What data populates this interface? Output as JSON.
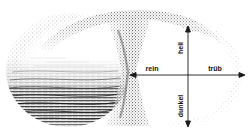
{
  "figure": {
    "title": "",
    "background_color": "#ffffff",
    "ink_color": "#111111"
  },
  "axes": {
    "center": {
      "x": 188,
      "y": 75
    },
    "horizontal": {
      "x1": 132,
      "x2": 245,
      "y": 75
    },
    "vertical": {
      "y1": 26,
      "y2": 127,
      "x": 188
    },
    "labels": {
      "top": "hell",
      "bottom": "dunkel",
      "left": "rein",
      "right": "trüb"
    }
  },
  "lobes": [
    {
      "name": "left-lobe",
      "cx": 68,
      "cy": 70,
      "rx": 62,
      "ry": 58,
      "fill": "hatched",
      "hatch_note": "dense horizontal scribble in lower half, white upper half"
    },
    {
      "name": "right-lobe",
      "cx": 188,
      "cy": 75,
      "rx": 54,
      "ry": 52,
      "fill": "white",
      "hatch_note": "clear interior containing axis cross"
    }
  ],
  "neck": {
    "name": "stipple-neck",
    "note": "dark stippled hourglass joining the two lobes",
    "x": 118,
    "width": 26
  }
}
